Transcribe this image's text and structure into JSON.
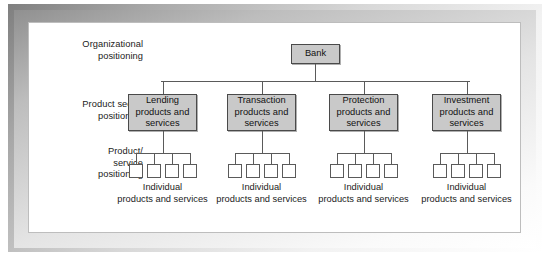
{
  "diagram": {
    "row_labels": [
      {
        "id": "organizational",
        "text": "Organizational\npositioning"
      },
      {
        "id": "product-sector",
        "text": "Product sector\npositioning"
      },
      {
        "id": "product-service",
        "text": "Product/\nservice\npositioning"
      }
    ],
    "root": {
      "label": "Bank"
    },
    "sectors": [
      {
        "label": "Lending\nproducts and\nservices",
        "caption": "Individual\nproducts and services",
        "leaf_count": 4
      },
      {
        "label": "Transaction\nproducts and\nservices",
        "caption": "Individual\nproducts and services",
        "leaf_count": 4
      },
      {
        "label": "Protection\nproducts and\nservices",
        "caption": "Individual\nproducts and services",
        "leaf_count": 4
      },
      {
        "label": "Investment\nproducts and\nservices",
        "caption": "Individual\nproducts and services",
        "leaf_count": 4
      }
    ],
    "colors": {
      "box_fill": "#c9c9c9",
      "box_border": "#4a4a4a",
      "leaf_fill": "#ffffff",
      "line": "#5a5a5a",
      "panel_bg": "#ffffff",
      "text": "#1b1b1b"
    }
  }
}
